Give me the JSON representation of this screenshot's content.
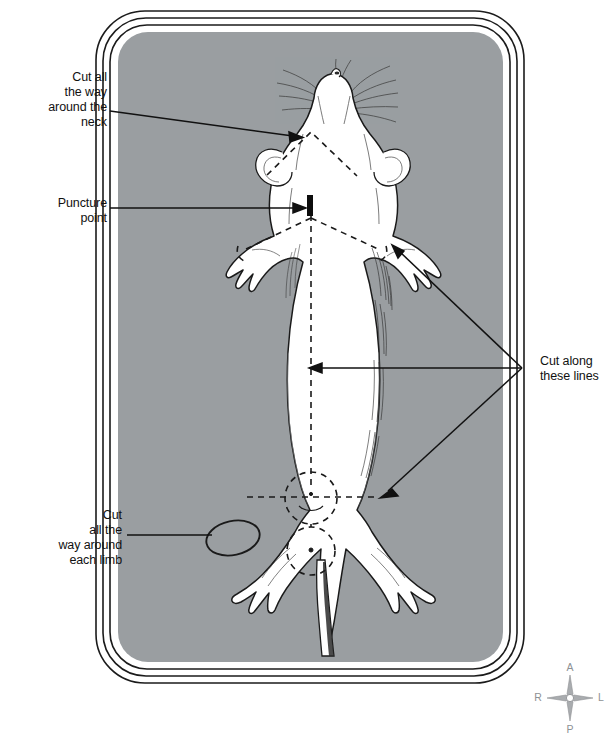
{
  "figure": {
    "panel_color": "#9a9ea1",
    "body_color": "#ffffff",
    "ink_color": "#111111",
    "compass_color": "#8e9194"
  },
  "annotations": [
    {
      "id": "cut-around-neck",
      "text": "Cut all\nthe way\naround the\nneck",
      "align": "right",
      "x": 107,
      "y": 70
    },
    {
      "id": "puncture-point",
      "text": "Puncture\npoint",
      "align": "right",
      "x": 107,
      "y": 196
    },
    {
      "id": "cut-along-these-lines",
      "text": "Cut along\nthese lines",
      "align": "left",
      "x": 540,
      "y": 354
    },
    {
      "id": "cut-around-each-limb",
      "text": "Cut\nall the\nway around\neach limb",
      "align": "right",
      "x": 122,
      "y": 508
    }
  ],
  "compass": {
    "name": "anatomical-orientation-compass",
    "center_x": 570,
    "center_y": 698,
    "labels": {
      "top": "A",
      "bottom": "P",
      "left": "R",
      "right": "L"
    }
  },
  "markers": {
    "puncture_point": {
      "x": 310,
      "y": 195,
      "height": 21
    }
  },
  "leader_lines": [
    {
      "id": "neck-leader",
      "from": [
        110,
        111
      ],
      "to": [
        297,
        137
      ]
    },
    {
      "id": "puncture-leader",
      "from": [
        110,
        208
      ],
      "to": [
        305,
        208
      ]
    },
    {
      "id": "limb-leader",
      "from": [
        125,
        535
      ],
      "to": [
        213,
        535
      ]
    },
    {
      "id": "cut-lines-leader-upper",
      "from": [
        522,
        368
      ],
      "to": [
        395,
        248
      ]
    },
    {
      "id": "cut-lines-leader-middle",
      "from": [
        522,
        368
      ],
      "to": [
        310,
        368
      ]
    },
    {
      "id": "cut-lines-leader-lower",
      "from": [
        522,
        368
      ],
      "to": [
        381,
        497
      ]
    }
  ]
}
